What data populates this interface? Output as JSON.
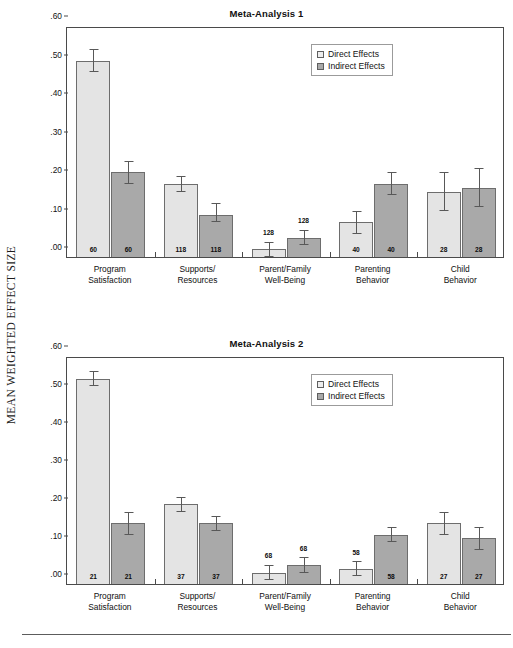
{
  "figure": {
    "y_axis_caption": "MEAN WEIGHTED EFFECT SIZE",
    "bar_colors": {
      "direct": "#e4e4e4",
      "indirect": "#a9a9a9"
    },
    "axis_color": "#4a4a4a"
  },
  "legend": {
    "direct_label": "Direct Effects",
    "indirect_label": "Indirect Effects"
  },
  "chart_data": [
    {
      "type": "bar",
      "title": "Meta-Analysis 1",
      "xlabel": "",
      "ylabel": "MEAN WEIGHTED EFFECT SIZE",
      "ylim": [
        0,
        0.6
      ],
      "yticks": [
        ".00",
        ".10",
        ".20",
        ".30",
        ".40",
        ".50",
        ".60"
      ],
      "ytick_values": [
        0.0,
        0.1,
        0.2,
        0.3,
        0.4,
        0.5,
        0.6
      ],
      "grid": false,
      "legend_position": "top-right",
      "categories": [
        "Program\nSatisfaction",
        "Supports/\nResources",
        "Parent/Family\nWell-Being",
        "Parenting\nBehavior",
        "Child\nBehavior"
      ],
      "category_lines": [
        [
          "Program",
          "Satisfaction"
        ],
        [
          "Supports/",
          "Resources"
        ],
        [
          "Parent/Family",
          "Well-Being"
        ],
        [
          "Parenting",
          "Behavior"
        ],
        [
          "Child",
          "Behavior"
        ]
      ],
      "series": [
        {
          "name": "Direct Effects",
          "values": [
            0.51,
            0.19,
            0.02,
            0.09,
            0.17
          ],
          "err_low": [
            0.03,
            0.02,
            0.02,
            0.03,
            0.05
          ],
          "err_high": [
            0.03,
            0.02,
            0.02,
            0.03,
            0.05
          ],
          "n_labels": [
            "60",
            "118",
            "128",
            "40",
            "28"
          ],
          "n_label_position": [
            "inside",
            "inside",
            "outside",
            "inside",
            "inside"
          ]
        },
        {
          "name": "Indirect Effects",
          "values": [
            0.22,
            0.11,
            0.05,
            0.19,
            0.18
          ],
          "err_low": [
            0.03,
            0.02,
            0.02,
            0.03,
            0.05
          ],
          "err_high": [
            0.03,
            0.03,
            0.02,
            0.03,
            0.05
          ],
          "n_labels": [
            "60",
            "118",
            "128",
            "40",
            "28"
          ],
          "n_label_position": [
            "inside",
            "inside",
            "outside",
            "inside",
            "inside"
          ]
        }
      ]
    },
    {
      "type": "bar",
      "title": "Meta-Analysis 2",
      "xlabel": "",
      "ylabel": "MEAN WEIGHTED EFFECT SIZE",
      "ylim": [
        0,
        0.6
      ],
      "yticks": [
        ".00",
        ".10",
        ".20",
        ".30",
        ".40",
        ".50",
        ".60"
      ],
      "ytick_values": [
        0.0,
        0.1,
        0.2,
        0.3,
        0.4,
        0.5,
        0.6
      ],
      "grid": false,
      "legend_position": "top-right",
      "categories": [
        "Program\nSatisfaction",
        "Supports/\nResources",
        "Parent/Family\nWell-Being",
        "Parenting\nBehavior",
        "Child\nBehavior"
      ],
      "category_lines": [
        [
          "Program",
          "Satisfaction"
        ],
        [
          "Supports/",
          "Resources"
        ],
        [
          "Parent/Family",
          "Well-Being"
        ],
        [
          "Parenting",
          "Behavior"
        ],
        [
          "Child",
          "Behavior"
        ]
      ],
      "series": [
        {
          "name": "Direct Effects",
          "values": [
            0.54,
            0.21,
            0.03,
            0.04,
            0.16
          ],
          "err_low": [
            0.02,
            0.02,
            0.02,
            0.02,
            0.03
          ],
          "err_high": [
            0.02,
            0.02,
            0.02,
            0.02,
            0.03
          ],
          "n_labels": [
            "21",
            "37",
            "68",
            "58",
            "27"
          ],
          "n_label_position": [
            "inside",
            "inside",
            "outside",
            "outside",
            "inside"
          ]
        },
        {
          "name": "Indirect Effects",
          "values": [
            0.16,
            0.16,
            0.05,
            0.13,
            0.12
          ],
          "err_low": [
            0.03,
            0.02,
            0.02,
            0.02,
            0.03
          ],
          "err_high": [
            0.03,
            0.02,
            0.02,
            0.02,
            0.03
          ],
          "n_labels": [
            "21",
            "37",
            "68",
            "58",
            "27"
          ],
          "n_label_position": [
            "inside",
            "inside",
            "outside",
            "inside",
            "inside"
          ]
        }
      ]
    }
  ]
}
